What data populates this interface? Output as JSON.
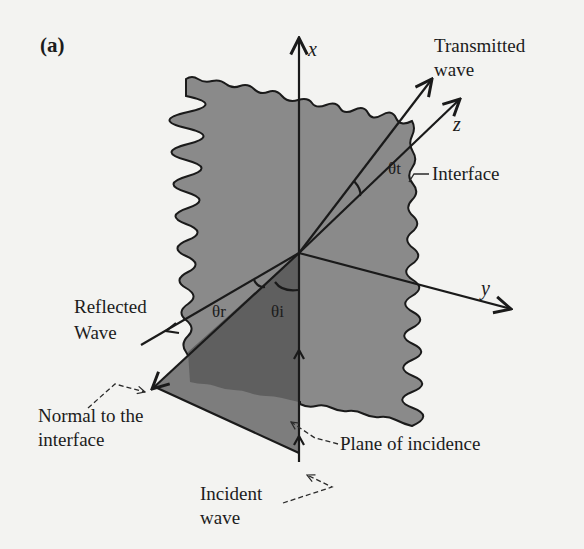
{
  "figure": {
    "panel_label": "(a)",
    "axes": {
      "x": "x",
      "y": "y",
      "z": "z"
    },
    "labels": {
      "transmitted_line1": "Transmitted",
      "transmitted_line2": "wave",
      "interface": "Interface",
      "reflected_line1": "Reflected",
      "reflected_line2": "Wave",
      "normal_line1": "Normal to the",
      "normal_line2": "interface",
      "plane_of_incidence": "Plane of incidence",
      "incident_line1": "Incident",
      "incident_line2": "wave"
    },
    "angles": {
      "transmitted": "θt",
      "reflected": "θr",
      "incident": "θi"
    },
    "colors": {
      "background": "#f3f3f1",
      "interface_fill": "#8a8a8a",
      "plane_fill": "#5f5f5f",
      "plane_lower_fill": "#7d7d7d",
      "line": "#1a1a1a"
    }
  }
}
